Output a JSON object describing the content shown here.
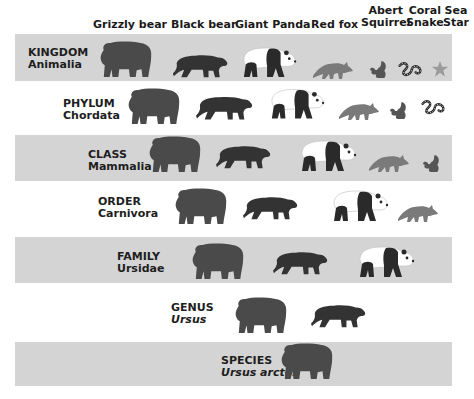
{
  "columns": [
    {
      "id": "grizzly",
      "label": "Grizzly bear"
    },
    {
      "id": "black",
      "label": "Black bear"
    },
    {
      "id": "panda",
      "label": "Giant Panda"
    },
    {
      "id": "fox",
      "label": "Red fox"
    },
    {
      "id": "squirrel",
      "label_line1": "Abert",
      "label_line2": "Squirrel"
    },
    {
      "id": "snake",
      "label_line1": "Coral",
      "label_line2": "Snake"
    },
    {
      "id": "star",
      "label_line1": "Sea",
      "label_line2": "Star"
    }
  ],
  "ranks": [
    {
      "rank": "KINGDOM",
      "taxon": "Animalia",
      "italic": false,
      "shaded": true,
      "members": [
        "grizzly",
        "black",
        "panda",
        "fox",
        "squirrel",
        "snake",
        "star"
      ]
    },
    {
      "rank": "PHYLUM",
      "taxon": "Chordata",
      "italic": false,
      "shaded": false,
      "members": [
        "grizzly",
        "black",
        "panda",
        "fox",
        "squirrel",
        "snake"
      ]
    },
    {
      "rank": "CLASS",
      "taxon": "Mammalia",
      "italic": false,
      "shaded": true,
      "members": [
        "grizzly",
        "black",
        "panda",
        "fox",
        "squirrel"
      ]
    },
    {
      "rank": "ORDER",
      "taxon": "Carnivora",
      "italic": false,
      "shaded": false,
      "members": [
        "grizzly",
        "black",
        "panda",
        "fox"
      ]
    },
    {
      "rank": "FAMILY",
      "taxon": "Ursidae",
      "italic": false,
      "shaded": true,
      "members": [
        "grizzly",
        "black",
        "panda"
      ]
    },
    {
      "rank": "GENUS",
      "taxon": "Ursus",
      "italic": true,
      "shaded": false,
      "members": [
        "grizzly",
        "black"
      ]
    },
    {
      "rank": "SPECIES",
      "taxon": "Ursus arctos",
      "italic": true,
      "shaded": true,
      "members": [
        "grizzly"
      ]
    }
  ],
  "colors": {
    "band": "#d4d4d4",
    "bear_dark": "#3a3a3a",
    "grizzly": "#4a4a4a",
    "fox": "#7a7a7a",
    "text": "#1e1e1e"
  }
}
